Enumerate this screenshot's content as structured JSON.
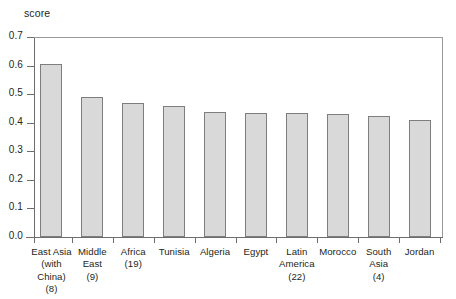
{
  "chart_data": {
    "type": "bar",
    "title": "",
    "xlabel": "",
    "ylabel": "score",
    "ylim": [
      0.0,
      0.7
    ],
    "ytick_labels": [
      "0.0",
      "0.1",
      "0.2",
      "0.3",
      "0.4",
      "0.5",
      "0.6",
      "0.7"
    ],
    "ytick_values": [
      0.0,
      0.1,
      0.2,
      0.3,
      0.4,
      0.5,
      0.6,
      0.7
    ],
    "grid": false,
    "legend": "none",
    "bar_fill_color": "#d9d9d9",
    "bar_border_color": "#7e7e7e",
    "axis_color": "#6d6d6d",
    "categories": [
      "East Asia\n(with China)\n(8)",
      "Middle\nEast\n(9)",
      "Africa\n(19)",
      "Tunisia",
      "Algeria",
      "Egypt",
      "Latin\nAmerica\n(22)",
      "Morocco",
      "South\nAsia\n(4)",
      "Jordan"
    ],
    "values": [
      0.607,
      0.49,
      0.47,
      0.457,
      0.436,
      0.433,
      0.433,
      0.43,
      0.423,
      0.408
    ]
  }
}
